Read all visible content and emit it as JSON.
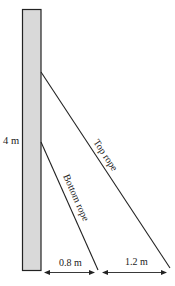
{
  "diagram": {
    "type": "physics-statics",
    "post": {
      "height_label": "4 m",
      "fill": "#d9d9d9",
      "stroke": "#222222"
    },
    "ropes": [
      {
        "id": "top",
        "label": "Top rope",
        "horizontal_distance_label": "1.2 m"
      },
      {
        "id": "bottom",
        "label": "Bottom rope",
        "horizontal_distance_label": "0.8 m"
      }
    ],
    "dimensions": {
      "post_height": "4 m",
      "bottom_rope_offset": "0.8 m",
      "gap_between_ropes": "1.2 m"
    }
  }
}
